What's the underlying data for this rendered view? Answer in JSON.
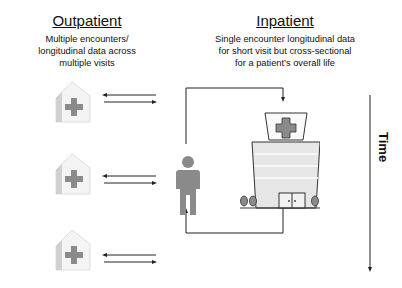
{
  "outpatient": {
    "title": "Outpatient",
    "description": [
      "Multiple encounters/",
      "longitudinal data across",
      "multiple visits"
    ],
    "clinics": [
      {
        "icon": "clinic-house-icon"
      },
      {
        "icon": "clinic-house-icon"
      },
      {
        "icon": "clinic-house-icon"
      }
    ]
  },
  "inpatient": {
    "title": "Inpatient",
    "description": [
      "Single encounter longitudinal data",
      "for short visit but cross-sectional",
      "for a patient’s overall life"
    ],
    "patient_icon": "person-icon",
    "hospital_icon": "hospital-icon"
  },
  "time_axis": {
    "label": "Time"
  },
  "colors": {
    "icon_gray": "#8a8a8a",
    "line": "#222222",
    "building": "#e6e6e6"
  }
}
